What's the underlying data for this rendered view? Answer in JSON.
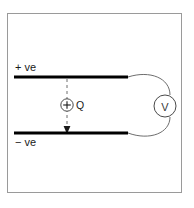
{
  "figure": {
    "name": "parallel-plate-capacitor-with-voltmeter",
    "background_color": "#ffffff",
    "frame": {
      "border_color": "#9a9a9a",
      "fill_color": "#ffffff"
    }
  },
  "plates": {
    "top": {
      "label": "+ ve",
      "color": "#000000"
    },
    "bottom": {
      "label": "− ve",
      "color": "#000000"
    }
  },
  "charge": {
    "symbol": "+",
    "label": "Q",
    "outline_color": "#4a4a4a"
  },
  "field_line": {
    "style": "dashed",
    "color": "#6e6e6e",
    "arrow_direction": "down"
  },
  "meter": {
    "label": "V",
    "name": "voltmeter",
    "outline_color": "#4a4a4a"
  },
  "wire": {
    "color": "#6e6e6e"
  }
}
